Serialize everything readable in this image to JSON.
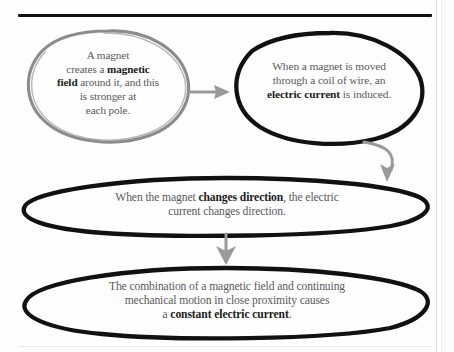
{
  "page": {
    "background_color": "#fefefe",
    "text_color": "#58585a",
    "bold_color": "#1b1b1b"
  },
  "rules": {
    "top_rule_color": "#111111",
    "bottom_rule_color": "#e8e8e8"
  },
  "nodes": [
    {
      "id": "node-magnet-field",
      "outline_color": "#8c8c8c",
      "shape": "ellipse",
      "lines": [
        {
          "segments": [
            {
              "text": "A magnet",
              "bold": false
            }
          ]
        },
        {
          "segments": [
            {
              "text": "creates a ",
              "bold": false
            },
            {
              "text": "magnetic",
              "bold": true
            }
          ]
        },
        {
          "segments": [
            {
              "text": "field",
              "bold": true
            },
            {
              "text": " around it, and this",
              "bold": false
            }
          ]
        },
        {
          "segments": [
            {
              "text": "is stronger at",
              "bold": false
            }
          ]
        },
        {
          "segments": [
            {
              "text": "each pole.",
              "bold": false
            }
          ]
        }
      ],
      "plain_text": "A magnet creates a magnetic field around it, and this is stronger at each pole."
    },
    {
      "id": "node-electric-current-induced",
      "outline_color": "#111111",
      "shape": "ellipse",
      "lines": [
        {
          "segments": [
            {
              "text": "When a magnet is moved",
              "bold": false
            }
          ]
        },
        {
          "segments": [
            {
              "text": "through a coil of wire, an",
              "bold": false
            }
          ]
        },
        {
          "segments": [
            {
              "text": "electric current",
              "bold": true
            },
            {
              "text": " is induced.",
              "bold": false
            }
          ]
        }
      ],
      "plain_text": "When a magnet is moved through a coil of wire, an electric current is induced."
    },
    {
      "id": "node-changes-direction",
      "outline_color": "#111111",
      "shape": "ellipse",
      "lines": [
        {
          "segments": [
            {
              "text": "When the magnet ",
              "bold": false
            },
            {
              "text": "changes direction",
              "bold": true
            },
            {
              "text": ", the electric",
              "bold": false
            }
          ]
        },
        {
          "segments": [
            {
              "text": "current changes direction.",
              "bold": false
            }
          ]
        }
      ],
      "plain_text": "When the magnet changes direction, the electric current changes direction."
    },
    {
      "id": "node-constant-current",
      "outline_color": "#111111",
      "shape": "ellipse",
      "lines": [
        {
          "segments": [
            {
              "text": "The combination of a magnetic field and continuing",
              "bold": false
            }
          ]
        },
        {
          "segments": [
            {
              "text": "mechanical motion in close proximity causes",
              "bold": false
            }
          ]
        },
        {
          "segments": [
            {
              "text": "a ",
              "bold": false
            },
            {
              "text": "constant electric current",
              "bold": true
            },
            {
              "text": ".",
              "bold": false
            }
          ]
        }
      ],
      "plain_text": "The combination of a magnetic field and continuing mechanical motion in close proximity causes a constant electric current."
    }
  ],
  "connectors": [
    {
      "id": "arrow-1-to-2",
      "direction": "right",
      "color": "#9a9a9a"
    },
    {
      "id": "arrow-2-to-3",
      "direction": "down-left-curve",
      "color": "#9a9a9a"
    },
    {
      "id": "arrow-3-to-4",
      "direction": "down",
      "color": "#9a9a9a"
    }
  ]
}
